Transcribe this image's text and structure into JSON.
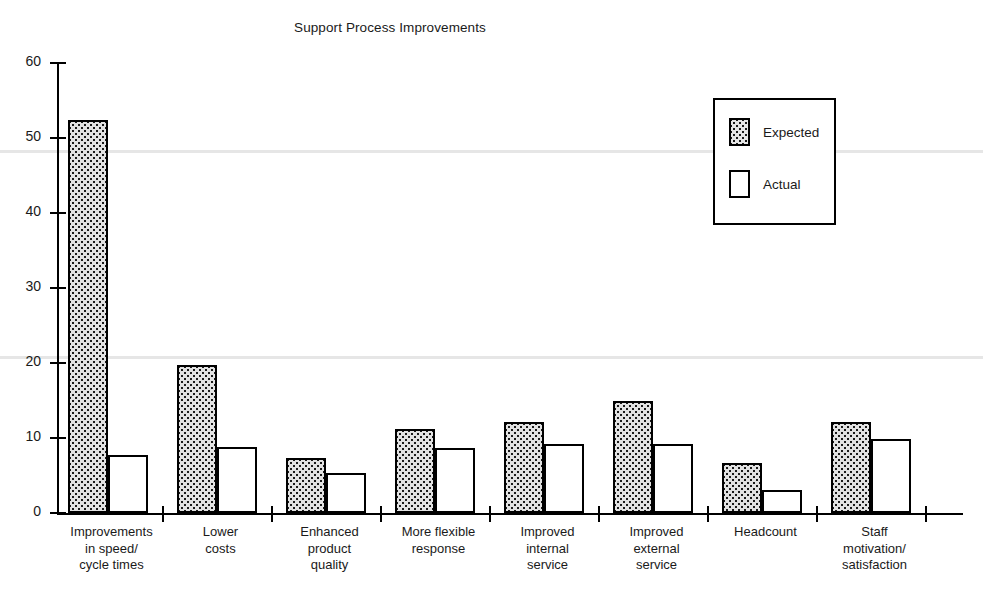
{
  "chart_data": {
    "type": "bar",
    "title": "Support Process Improvements",
    "xlabel": "",
    "ylabel": "",
    "ylim": [
      0,
      60
    ],
    "yticks": [
      0,
      10,
      20,
      30,
      40,
      50,
      60
    ],
    "grid": false,
    "legend_position": "upper-right",
    "categories": [
      "Improvements\nin speed/\ncycle times",
      "Lower\ncosts",
      "Enhanced\nproduct\nquality",
      "More flexible\nresponse",
      "Improved\ninternal\nservice",
      "Improved\nexternal\nservice",
      "Headcount",
      "Staff\nmotivation/\nsatisfaction"
    ],
    "series": [
      {
        "name": "Expected",
        "values": [
          52.4,
          19.7,
          7.3,
          11.2,
          12.1,
          14.9,
          6.7,
          12.2
        ]
      },
      {
        "name": "Actual",
        "values": [
          7.7,
          8.8,
          5.4,
          8.7,
          9.2,
          9.2,
          3.1,
          9.9
        ]
      }
    ]
  },
  "legend": {
    "items": [
      {
        "label": "Expected",
        "swatch": "dotted-pattern-swatch"
      },
      {
        "label": "Actual",
        "swatch": "white-swatch"
      }
    ]
  },
  "axis": {
    "y_tick_labels": [
      "60",
      "50",
      "40",
      "30",
      "20",
      "10",
      "0"
    ]
  }
}
